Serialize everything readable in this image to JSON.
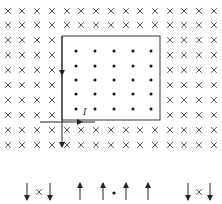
{
  "diagram": {
    "field_into_page_symbol": "×",
    "field_out_page_symbol": "•",
    "current_label": "I",
    "colors": {
      "ink": "#333333",
      "cross": "#555555",
      "background": "#ffffff"
    },
    "grid": {
      "cols_x": [
        8,
        22,
        37,
        52,
        67,
        81,
        96,
        111,
        126,
        140,
        155,
        170,
        184,
        199,
        214
      ],
      "rows_y": [
        11,
        25,
        40,
        55,
        70,
        85,
        100,
        115,
        130,
        145
      ]
    },
    "region": {
      "x1": 62,
      "y1": 36,
      "x2": 160,
      "y2": 120
    },
    "dots": {
      "cols_x": [
        76,
        95,
        114,
        133,
        151
      ],
      "rows_y": [
        51,
        66,
        80,
        94,
        109
      ]
    },
    "options": [
      {
        "name": "option-a",
        "arrows": [
          {
            "x": 27,
            "dir": "down"
          },
          {
            "x": 50,
            "dir": "down"
          }
        ],
        "symbol": "×",
        "symbol_x": 39
      },
      {
        "name": "option-b",
        "arrows": [
          {
            "x": 80,
            "dir": "up"
          },
          {
            "x": 103,
            "dir": "up"
          }
        ],
        "symbol": "",
        "symbol_x": 0
      },
      {
        "name": "option-c",
        "arrows": [
          {
            "x": 126,
            "dir": "up"
          },
          {
            "x": 148,
            "dir": "up"
          }
        ],
        "symbol": "•",
        "symbol_x": 114
      },
      {
        "name": "option-d",
        "arrows": [
          {
            "x": 188,
            "dir": "down"
          },
          {
            "x": 210,
            "dir": "down"
          }
        ],
        "symbol": "×",
        "symbol_x": 199
      }
    ]
  }
}
